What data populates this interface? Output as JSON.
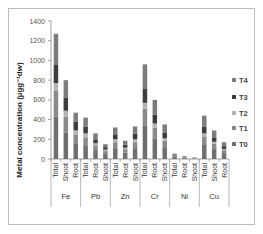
{
  "chart_data": {
    "type": "bar",
    "stacked": true,
    "title": "",
    "xlabel": "",
    "ylabel": "Metal concentration (µgg⁻¹dw)",
    "ylim": [
      0,
      1400
    ],
    "yticks": [
      0,
      200,
      400,
      600,
      800,
      1000,
      1200,
      1400
    ],
    "grid": false,
    "legend_position": "right",
    "groups": [
      {
        "name": "Fe",
        "categories": [
          "Total",
          "Shoot",
          "Root"
        ]
      },
      {
        "name": "Pb",
        "categories": [
          "Total",
          "Root",
          "Shoot"
        ]
      },
      {
        "name": "Zn",
        "categories": [
          "Total",
          "Root",
          "Shoot"
        ]
      },
      {
        "name": "Cr",
        "categories": [
          "Total",
          "Root",
          "Shoot"
        ]
      },
      {
        "name": "Ni",
        "categories": [
          "Total",
          "Root",
          "Shoot"
        ]
      },
      {
        "name": "Cu",
        "categories": [
          "Total",
          "Shoot",
          "Root"
        ]
      }
    ],
    "categories": [
      "Fe Total",
      "Fe Shoot",
      "Fe Root",
      "Pb Total",
      "Pb Root",
      "Pb Shoot",
      "Zn Total",
      "Zn Root",
      "Zn Shoot",
      "Cr Total",
      "Cr Root",
      "Cr Shoot",
      "Ni Total",
      "Ni Root",
      "Ni Shoot",
      "Cu Total",
      "Cu Shoot",
      "Cu Root"
    ],
    "series": [
      {
        "name": "T0",
        "color": "#6f6f6f",
        "values": [
          430,
          270,
          160,
          140,
          90,
          50,
          110,
          65,
          110,
          340,
          210,
          120,
          20,
          10,
          5,
          150,
          100,
          60
        ]
      },
      {
        "name": "T1",
        "color": "#8a8a8a",
        "values": [
          260,
          160,
          90,
          80,
          50,
          30,
          60,
          35,
          60,
          170,
          110,
          65,
          10,
          6,
          3,
          80,
          55,
          30
        ]
      },
      {
        "name": "T2",
        "color": "#b5b5b5",
        "values": [
          80,
          60,
          40,
          40,
          20,
          15,
          30,
          15,
          30,
          60,
          40,
          25,
          5,
          3,
          2,
          30,
          20,
          12
        ]
      },
      {
        "name": "T3",
        "color": "#3d3d3d",
        "values": [
          190,
          130,
          90,
          70,
          40,
          25,
          50,
          30,
          55,
          140,
          90,
          60,
          8,
          5,
          2,
          70,
          45,
          28
        ]
      },
      {
        "name": "T4",
        "color": "#7c7c7c",
        "values": [
          310,
          180,
          90,
          90,
          60,
          30,
          70,
          40,
          75,
          250,
          150,
          80,
          12,
          6,
          3,
          110,
          70,
          40
        ]
      }
    ],
    "totals": [
      1270,
      800,
      470,
      420,
      260,
      150,
      320,
      185,
      330,
      960,
      600,
      350,
      55,
      30,
      15,
      440,
      290,
      170
    ]
  }
}
